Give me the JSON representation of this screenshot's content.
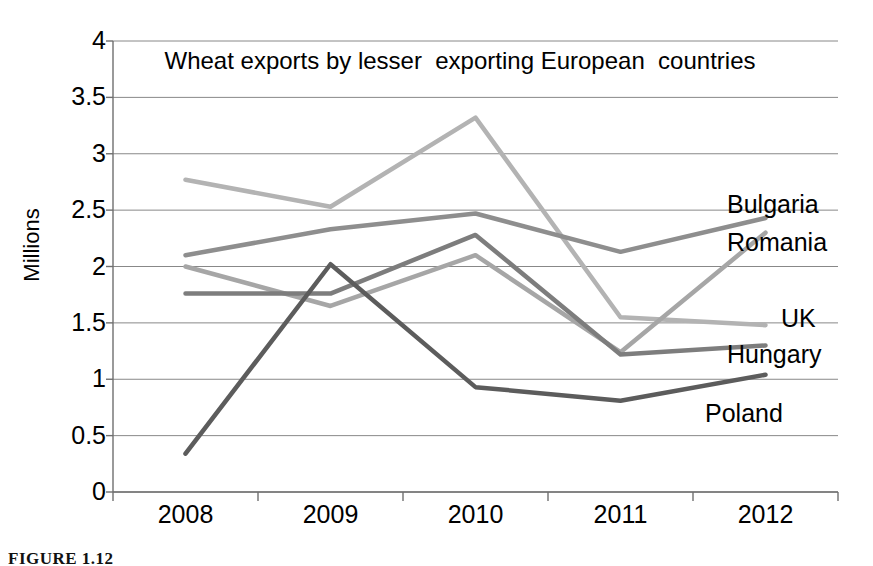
{
  "figure": {
    "caption": "FIGURE 1.12"
  },
  "chart_data": {
    "type": "line",
    "title": "Wheat exports by lesser  exporting European  countries",
    "xlabel": "",
    "ylabel": "Millions",
    "categories": [
      "2008",
      "2009",
      "2010",
      "2011",
      "2012"
    ],
    "ylim": [
      0,
      4
    ],
    "ytick_labels": [
      "4",
      "3.5",
      "3",
      "2.5",
      "2",
      "1.5",
      "1",
      "0.5",
      "0"
    ],
    "ytick_values": [
      4,
      3.5,
      3,
      2.5,
      2,
      1.5,
      1,
      0.5,
      0
    ],
    "grid": true,
    "legend_position": "right-end-labels",
    "series": [
      {
        "name": "Bulgaria",
        "color": "#b3b3b3",
        "values": [
          2.77,
          2.53,
          3.32,
          1.55,
          1.48
        ],
        "label_x": 727,
        "label_y": 191
      },
      {
        "name": "Romania",
        "color": "#8e8e8e",
        "values": [
          2.1,
          2.33,
          2.47,
          2.13,
          2.43
        ],
        "label_x": 727,
        "label_y": 229
      },
      {
        "name": "UK",
        "color": "#a6a6a6",
        "values": [
          2.0,
          1.65,
          2.1,
          1.24,
          2.3
        ],
        "label_x": 781,
        "label_y": 305
      },
      {
        "name": "Hungary",
        "color": "#7d7d7d",
        "values": [
          1.76,
          1.76,
          2.28,
          1.22,
          1.3
        ],
        "label_x": 727,
        "label_y": 341
      },
      {
        "name": "Poland",
        "color": "#5c5c5c",
        "values": [
          0.34,
          2.02,
          0.93,
          0.81,
          1.04
        ],
        "label_x": 705,
        "label_y": 400
      }
    ]
  },
  "axes": {
    "grid_color": "#888888",
    "axis_color": "#6f6f6f"
  }
}
